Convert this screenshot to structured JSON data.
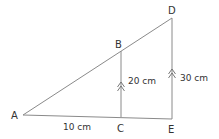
{
  "diagram": {
    "type": "similar-triangles",
    "points": {
      "A": {
        "label": "A",
        "x": 23,
        "y": 115
      },
      "B": {
        "label": "B",
        "x": 121,
        "y": 51
      },
      "C": {
        "label": "C",
        "x": 121,
        "y": 117
      },
      "D": {
        "label": "D",
        "x": 172,
        "y": 18
      },
      "E": {
        "label": "E",
        "x": 172,
        "y": 119
      }
    },
    "segments": [
      {
        "from": "A",
        "to": "D"
      },
      {
        "from": "A",
        "to": "E"
      },
      {
        "from": "B",
        "to": "C"
      },
      {
        "from": "D",
        "to": "E"
      }
    ],
    "measurements": {
      "BC": "20 cm",
      "DE": "30 cm",
      "AC": "10 cm"
    },
    "parallel_marks": [
      "BC",
      "DE"
    ],
    "colors": {
      "line": "#8a8a8a",
      "text": "#333333",
      "background": "#ffffff"
    }
  }
}
